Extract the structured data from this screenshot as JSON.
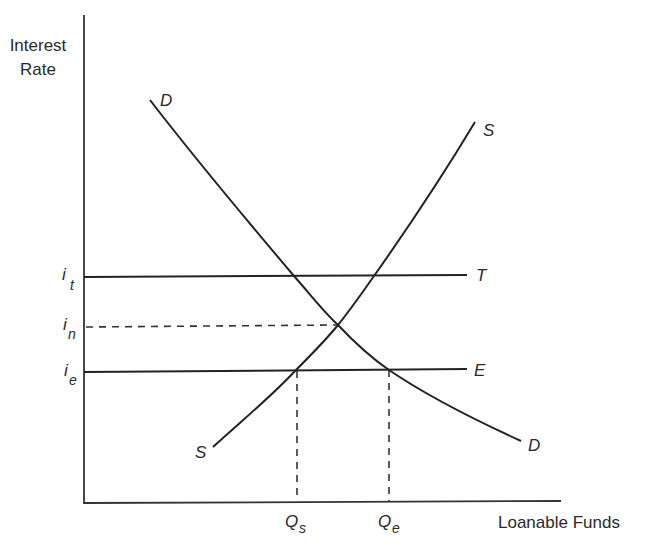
{
  "diagram": {
    "type": "loanable-funds-market",
    "y_axis": {
      "title_line1": "Interest",
      "title_line2": "Rate"
    },
    "x_axis": {
      "title": "Loanable Funds"
    },
    "curves": {
      "demand": {
        "label_top": "D",
        "label_bottom": "D"
      },
      "supply": {
        "label_top": "S",
        "label_bottom": "S"
      }
    },
    "horizontal_lines": {
      "T": {
        "label": "T"
      },
      "E": {
        "label": "E"
      }
    },
    "y_ticks": {
      "it": {
        "base": "i",
        "sub": "t"
      },
      "in": {
        "base": "i",
        "sub": "n"
      },
      "ie": {
        "base": "i",
        "sub": "e"
      }
    },
    "x_ticks": {
      "qs": {
        "base": "Q",
        "sub": "s"
      },
      "qe": {
        "base": "Q",
        "sub": "e"
      }
    }
  },
  "colors": {
    "line": "#222222",
    "background": "#ffffff"
  }
}
